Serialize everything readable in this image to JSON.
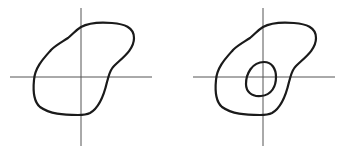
{
  "diagram": {
    "description": "Two planar regions drawn on crossed coordinate axes",
    "colors": {
      "background": "#ffffff",
      "axis": "#555555",
      "curve": "#1a1a1a"
    },
    "figures": [
      {
        "id": "left",
        "label": "Simply connected region containing the origin",
        "axes": {
          "horizontal": {
            "x1": 10,
            "x2": 152,
            "y": 77
          },
          "vertical": {
            "x": 81,
            "y1": 8,
            "y2": 146
          }
        },
        "boundaries": [
          {
            "type": "outer",
            "path": "M 81 27 C 90 22, 100 22, 112 23 C 124 24, 134 27, 134 38 C 134 50, 122 58, 114 66 C 109 71, 109 76, 107 82 C 104 95, 99 108, 90 113 C 86 115, 83 115, 78 115 C 63 115, 50 114, 40 107 C 33 101, 33 90, 34 80 C 35 67, 44 58, 51 50 C 56 45, 62 42, 68 38 C 73 34, 76 30, 81 27 Z"
          }
        ]
      },
      {
        "id": "right",
        "label": "Region with a hole around the origin",
        "axes": {
          "horizontal": {
            "x1": 193,
            "x2": 335,
            "y": 77
          },
          "vertical": {
            "x": 263,
            "y1": 8,
            "y2": 146
          }
        },
        "boundaries": [
          {
            "type": "outer",
            "path": "M 263 27 C 272 22, 282 22, 294 23 C 306 24, 316 27, 316 38 C 316 50, 304 58, 296 66 C 291 71, 291 76, 289 82 C 286 95, 281 108, 272 113 C 268 115, 265 115, 260 115 C 245 115, 232 114, 222 107 C 215 101, 215 90, 216 80 C 217 67, 226 58, 233 50 C 238 45, 244 42, 250 38 C 255 34, 258 30, 263 27 Z"
          },
          {
            "type": "inner-hole",
            "path": "M 264 62 C 272 62, 276 69, 276 77 C 276 86, 272 95, 261 96 C 251 97, 246 91, 246 84 C 246 74, 252 62, 264 62 Z"
          }
        ]
      }
    ]
  }
}
